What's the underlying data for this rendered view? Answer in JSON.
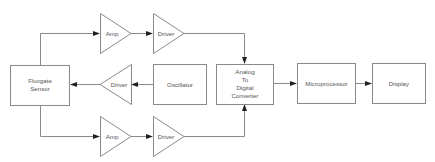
{
  "diagram": {
    "title": "",
    "nodes": {
      "sensor": {
        "lines": [
          "Fluxgate",
          "Sensor"
        ],
        "shape": "box"
      },
      "amp_top": {
        "lines": [
          "Amp"
        ],
        "shape": "triangle-right"
      },
      "driver_top": {
        "lines": [
          "Driver"
        ],
        "shape": "triangle-right"
      },
      "driver_mid": {
        "lines": [
          "Driver"
        ],
        "shape": "triangle-left"
      },
      "oscillator": {
        "lines": [
          "Oscillator"
        ],
        "shape": "box"
      },
      "amp_bottom": {
        "lines": [
          "Amp"
        ],
        "shape": "triangle-right"
      },
      "driver_bottom": {
        "lines": [
          "Driver"
        ],
        "shape": "triangle-right"
      },
      "adc": {
        "lines": [
          "Analog",
          "To",
          "Digital",
          "Converter"
        ],
        "shape": "box"
      },
      "microprocessor": {
        "lines": [
          "Microprocessor"
        ],
        "shape": "box"
      },
      "display": {
        "lines": [
          "Display"
        ],
        "shape": "box"
      }
    },
    "edges": [
      {
        "from": "sensor",
        "to": "amp_top"
      },
      {
        "from": "amp_top",
        "to": "driver_top"
      },
      {
        "from": "driver_top",
        "to": "adc"
      },
      {
        "from": "oscillator",
        "to": "driver_mid"
      },
      {
        "from": "driver_mid",
        "to": "sensor"
      },
      {
        "from": "sensor",
        "to": "amp_bottom"
      },
      {
        "from": "amp_bottom",
        "to": "driver_bottom"
      },
      {
        "from": "driver_bottom",
        "to": "adc"
      },
      {
        "from": "adc",
        "to": "microprocessor"
      },
      {
        "from": "microprocessor",
        "to": "display"
      }
    ],
    "colors": {
      "stroke": "#8a8a8a",
      "arrowhead": "#222222",
      "text": "#555555"
    }
  }
}
